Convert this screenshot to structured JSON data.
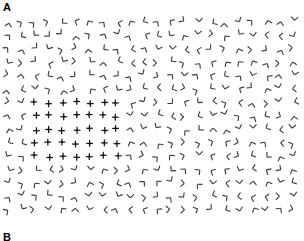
{
  "figure": {
    "type": "texture-segmentation-stimulus",
    "panel_labels": [
      {
        "id": "A",
        "text": "A",
        "position": "top-left"
      },
      {
        "id": "B",
        "text": "B",
        "position": "bottom-left",
        "clipped": true
      }
    ],
    "background_color": "#ffffff",
    "element_color": "#3a3a3a",
    "target_color": "#111111"
  },
  "stimulus": {
    "field": {
      "x": 0,
      "y": 14,
      "width": 304,
      "height": 202
    },
    "background_texture": {
      "element_name": "corner-L-element",
      "description": "randomly rotated right-angle corner (two short segments joined at a vertex)",
      "arm_length": 5.0,
      "stroke_width": 1.1,
      "spacing_x": 13.6,
      "spacing_y": 13.4,
      "jitter": 3.2,
      "columns": 22,
      "rows": 15,
      "origin_x": 8,
      "origin_y": 8
    },
    "target_patch": {
      "element_name": "plus-cross-element",
      "description": "upright plus / cross with a small filled square at the junction",
      "arm_length": 3.4,
      "stroke_width": 1.2,
      "dot_size": 1.8,
      "col_start": 2,
      "col_end": 8,
      "row_start": 6,
      "row_end": 10,
      "bounds": {
        "x": 38,
        "y": 94,
        "width": 80,
        "height": 52
      }
    },
    "seed": 20240917
  },
  "chart_data": {
    "type": "scatter",
    "title": "",
    "xlabel": "",
    "ylabel": "",
    "grid": false,
    "legend": "none",
    "series": [
      {
        "name": "background elements (L corners)",
        "marker": "corner-L",
        "color": "#3a3a3a",
        "count": 306
      },
      {
        "name": "target patch elements (plus crosses)",
        "marker": "plus-cross",
        "color": "#111111",
        "count": 35
      }
    ],
    "xlim": [
      0,
      304
    ],
    "ylim": [
      14,
      216
    ]
  }
}
